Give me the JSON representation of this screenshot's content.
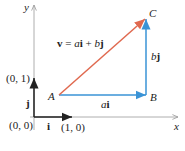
{
  "diagram": {
    "axes": {
      "x_label": "x",
      "y_label": "y"
    },
    "points": {
      "A": "A",
      "B": "B",
      "C": "C",
      "origin": "(0, 0)",
      "unit_x": "(1, 0)",
      "unit_y": "(0, 1)"
    },
    "vectors": {
      "i_label": "i",
      "j_label": "j",
      "ai_label_coef": "a",
      "ai_label_vec": "i",
      "bj_label_coef": "b",
      "bj_label_vec": "j",
      "v_bold": "v",
      "v_eq": " = ",
      "v_a": "a",
      "v_i": "i",
      "v_plus": " + ",
      "v_b": "b",
      "v_j": "j"
    },
    "colors": {
      "red": "#e0694f",
      "blue": "#3a93d6",
      "black": "#222222",
      "axis": "#999999"
    }
  }
}
